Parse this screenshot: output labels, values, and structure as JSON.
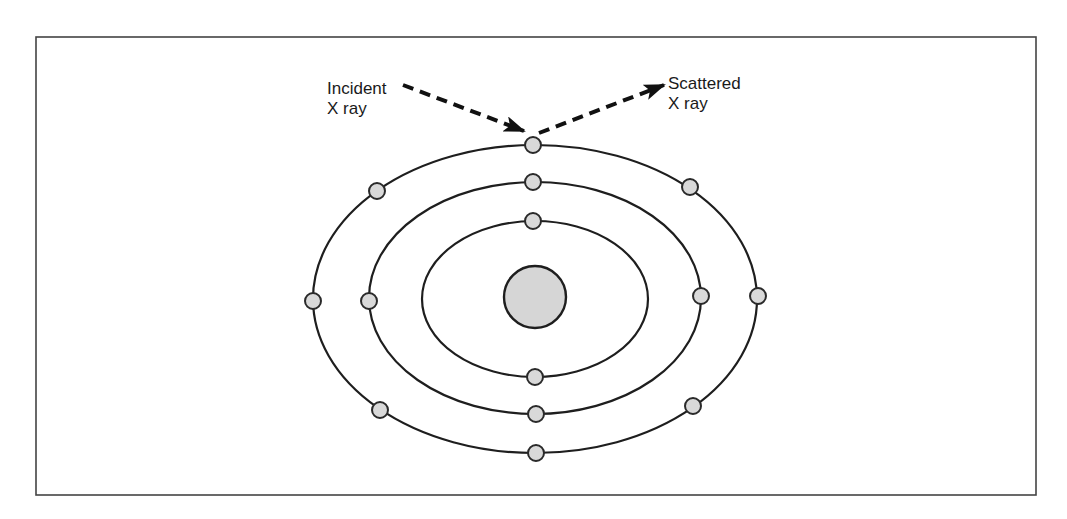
{
  "diagram": {
    "labels": {
      "incident_line1": "Incident",
      "incident_line2": "X ray",
      "scattered_line1": "Scattered",
      "scattered_line2": "X ray"
    },
    "colors": {
      "line": "#1e1e1e",
      "electron_fill": "#d9d9d9",
      "nucleus_fill": "#d6d6d6",
      "frame": "#444444"
    },
    "nucleus": {
      "cx": 535,
      "cy": 297,
      "r": 31,
      "icon": "nucleus-circle"
    },
    "orbits": [
      {
        "name": "inner",
        "cx": 535,
        "cy": 299,
        "rx": 113,
        "ry": 78
      },
      {
        "name": "middle",
        "cx": 535,
        "cy": 298,
        "rx": 166,
        "ry": 116
      },
      {
        "name": "outer",
        "cx": 535,
        "cy": 299,
        "rx": 222,
        "ry": 154
      }
    ],
    "electrons": [
      {
        "orbit": "inner",
        "cx": 533,
        "cy": 221
      },
      {
        "orbit": "inner",
        "cx": 535,
        "cy": 377
      },
      {
        "orbit": "middle",
        "cx": 533,
        "cy": 182
      },
      {
        "orbit": "middle",
        "cx": 536,
        "cy": 414
      },
      {
        "orbit": "middle",
        "cx": 369,
        "cy": 301
      },
      {
        "orbit": "middle",
        "cx": 701,
        "cy": 296
      },
      {
        "orbit": "outer",
        "cx": 533,
        "cy": 145
      },
      {
        "orbit": "outer",
        "cx": 536,
        "cy": 453
      },
      {
        "orbit": "outer",
        "cx": 313,
        "cy": 301
      },
      {
        "orbit": "outer",
        "cx": 758,
        "cy": 296
      },
      {
        "orbit": "outer",
        "cx": 377,
        "cy": 191
      },
      {
        "orbit": "outer",
        "cx": 690,
        "cy": 187
      },
      {
        "orbit": "outer",
        "cx": 380,
        "cy": 410
      },
      {
        "orbit": "outer",
        "cx": 693,
        "cy": 406
      }
    ],
    "arrows": [
      {
        "name": "incident-ray",
        "x1": 403,
        "y1": 85,
        "x2": 524,
        "y2": 131,
        "style": "dashed"
      },
      {
        "name": "scattered-ray",
        "x1": 539,
        "y1": 133,
        "x2": 664,
        "y2": 85,
        "style": "dashed"
      }
    ]
  }
}
